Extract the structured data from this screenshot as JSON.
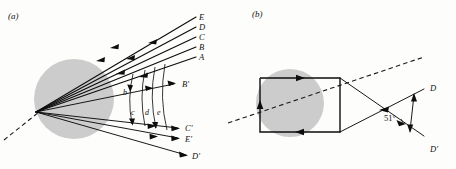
{
  "figure": {
    "width": 456,
    "height": 169,
    "background_color": "#fdfdfb",
    "ink_color": "#0d0d0d",
    "drop_fill_color": "#c8c8c8"
  },
  "panel_a": {
    "label": "(a)",
    "incoming_ray_labels": [
      "A",
      "B",
      "C",
      "D",
      "E"
    ],
    "outgoing_ray_labels": [
      "B'",
      "C'",
      "E'",
      "D'"
    ],
    "wavefront_labels": [
      "b",
      "c",
      "d",
      "e"
    ],
    "drop": {
      "shape": "circle",
      "center_x": 74,
      "center_y": 99,
      "radius": 40,
      "fill": "#c8c8c8"
    },
    "focus_point": {
      "x": 36,
      "y": 112
    },
    "axis_style": "dashed"
  },
  "panel_b": {
    "label": "(b)",
    "ray_labels": [
      "D",
      "D'"
    ],
    "angle_label": "51°",
    "angle_value": 51,
    "angle_unit": "degrees",
    "drop": {
      "shape": "circle",
      "center_x": 290,
      "center_y": 103,
      "radius": 34,
      "fill": "#c8c8c8"
    },
    "axis_style": "dashed",
    "internal_path": "square"
  }
}
